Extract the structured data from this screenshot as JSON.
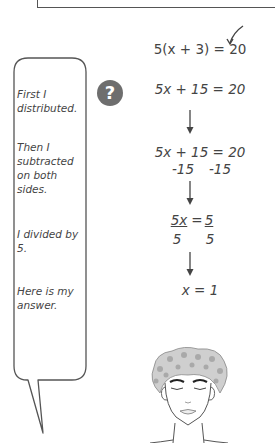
{
  "icons": {
    "question": "?",
    "check": "checkmark-arrow"
  },
  "speech_bubble": {
    "lines": [
      "First I distributed.",
      "Then I subtracted on both sides.",
      "I divided by 5.",
      "Here is my answer."
    ]
  },
  "steps": {
    "step1": "5(x + 3) = 20",
    "step2": "5x + 15 = 20",
    "step3_top": "5x + 15 = 20",
    "step3_sub_left": "-15",
    "step3_sub_right": "-15",
    "step4_num_left": "5x",
    "step4_eq": "=",
    "step4_num_right": "5",
    "step4_den_left": "5",
    "step4_den_right": "5",
    "step5": "x = 1"
  },
  "colors": {
    "ink": "#444444",
    "icon_bg": "#6e6e6e"
  }
}
